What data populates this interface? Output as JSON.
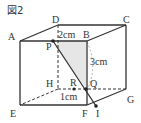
{
  "figure": {
    "title": "図2",
    "vertices": {
      "A": "A",
      "B": "B",
      "C": "C",
      "D": "D",
      "E": "E",
      "F": "F",
      "G": "G",
      "H": "H"
    },
    "points": {
      "P": "P",
      "Q": "Q",
      "R": "R",
      "I": "I"
    },
    "measurements": {
      "PB": "2cm",
      "BQ": "3cm",
      "RQ": "1cm"
    },
    "colors": {
      "line": "#333333",
      "shade": "#e6e6e6",
      "arc": "#999999"
    }
  }
}
